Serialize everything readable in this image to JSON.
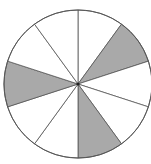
{
  "diagram": {
    "type": "fraction-circle",
    "total_segments": 10,
    "shaded_segments": [
      1,
      4,
      7
    ],
    "shaded_count": 3,
    "colors": {
      "shaded": "#a9a9a9",
      "unshaded": "#ffffff",
      "stroke": "#555555"
    }
  }
}
